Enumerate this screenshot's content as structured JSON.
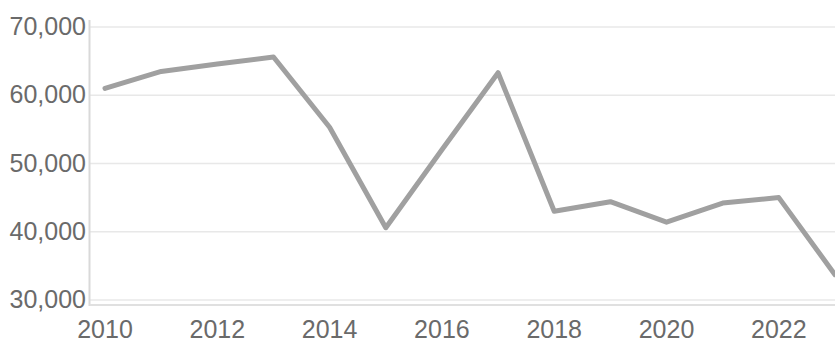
{
  "chart_data": {
    "type": "line",
    "title": "",
    "subtitle": "",
    "xlabel": "",
    "ylabel": "",
    "x": [
      2010,
      2011,
      2012,
      2013,
      2014,
      2015,
      2016,
      2017,
      2018,
      2019,
      2020,
      2021,
      2022,
      2023
    ],
    "values": [
      61000,
      63500,
      64600,
      65600,
      55300,
      40600,
      52000,
      63300,
      43000,
      44400,
      41400,
      44200,
      45000,
      33700
    ],
    "series": [
      {
        "name": "",
        "values": [
          61000,
          63500,
          64600,
          65600,
          55300,
          40600,
          52000,
          63300,
          43000,
          44400,
          41400,
          44200,
          45000,
          33700
        ]
      }
    ],
    "xlim": [
      2010,
      2023
    ],
    "ylim": [
      30000,
      70000
    ],
    "y_ticks": [
      30000,
      40000,
      50000,
      60000,
      70000
    ],
    "y_tick_labels": [
      "30,000",
      "40,000",
      "50,000",
      "60,000",
      "70,000"
    ],
    "x_ticks": [
      2010,
      2012,
      2014,
      2016,
      2018,
      2020,
      2022
    ],
    "x_tick_labels": [
      "2010",
      "2012",
      "2014",
      "2016",
      "2018",
      "2020",
      "2022"
    ],
    "grid": "horizontal",
    "legend": "none",
    "line_color": "#a0a0a0",
    "grid_color": "#e8e8e8",
    "axis_color": "#d9d9d9",
    "tick_label_color": "#6a6a6a",
    "line_width": 5
  },
  "axes": {
    "y_labels": [
      {
        "text": "70,000",
        "value": 70000
      },
      {
        "text": "60,000",
        "value": 60000
      },
      {
        "text": "50,000",
        "value": 50000
      },
      {
        "text": "40,000",
        "value": 40000
      },
      {
        "text": "30,000",
        "value": 30000
      }
    ],
    "x_labels": [
      {
        "text": "2010",
        "value": 2010
      },
      {
        "text": "2012",
        "value": 2012
      },
      {
        "text": "2014",
        "value": 2014
      },
      {
        "text": "2016",
        "value": 2016
      },
      {
        "text": "2018",
        "value": 2018
      },
      {
        "text": "2020",
        "value": 2020
      },
      {
        "text": "2022",
        "value": 2022
      }
    ]
  }
}
